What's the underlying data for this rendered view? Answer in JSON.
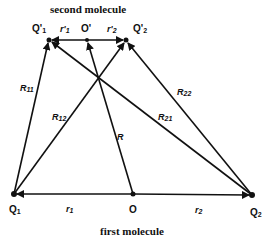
{
  "diagram": {
    "top_title": "second molecule",
    "bottom_title": "first molecule",
    "points": {
      "Q1": {
        "label": "Q",
        "sub": "1",
        "x": 14,
        "y": 194
      },
      "O": {
        "label": "O",
        "x": 133,
        "y": 194
      },
      "Q2": {
        "label": "Q",
        "sub": "2",
        "x": 252,
        "y": 195
      },
      "Q1p": {
        "label": "Q'",
        "sub": "1",
        "x": 49,
        "y": 40
      },
      "Op": {
        "label": "O'",
        "x": 87,
        "y": 40
      },
      "Q2p": {
        "label": "Q'",
        "sub": "2",
        "x": 126,
        "y": 40
      }
    },
    "segment_labels": {
      "r1": {
        "label": "r",
        "sub": "1"
      },
      "r2": {
        "label": "r",
        "sub": "2"
      },
      "r1p": {
        "label": "r'",
        "sub": "1"
      },
      "r2p": {
        "label": "r'",
        "sub": "2"
      }
    },
    "vectors": {
      "R11": {
        "label": "R",
        "sub": "11",
        "from": "Q1",
        "to": "Q1p"
      },
      "R12": {
        "label": "R",
        "sub": "12",
        "from": "Q1",
        "to": "Q2p"
      },
      "R21": {
        "label": "R",
        "sub": "21",
        "from": "Q2",
        "to": "Q1p"
      },
      "R22": {
        "label": "R",
        "sub": "22",
        "from": "Q2",
        "to": "Q2p"
      },
      "R": {
        "label": "R",
        "from": "O",
        "to": "Op"
      }
    },
    "line_color": "#111111"
  }
}
